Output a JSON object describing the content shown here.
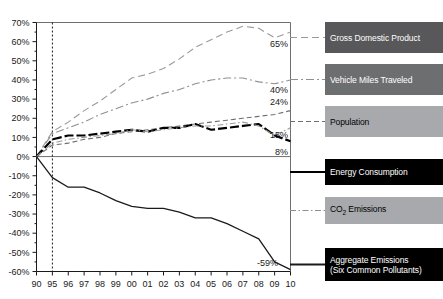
{
  "chart_data": {
    "type": "line",
    "title": "",
    "xlabel": "",
    "ylabel": "",
    "grid": false,
    "legend_position": "right",
    "x": [
      "90",
      "95",
      "96",
      "97",
      "98",
      "99",
      "00",
      "01",
      "02",
      "03",
      "04",
      "05",
      "06",
      "07",
      "08",
      "09",
      "10"
    ],
    "xtick_labels": [
      "90",
      "95",
      "96",
      "97",
      "98",
      "99",
      "00",
      "01",
      "02",
      "03",
      "04",
      "05",
      "06",
      "07",
      "08",
      "09",
      "10"
    ],
    "ytick_labels": [
      "70%",
      "60%",
      "50%",
      "40%",
      "30%",
      "20%",
      "10%",
      "0%",
      "-10%",
      "-20%",
      "-30%",
      "-40%",
      "-50%",
      "-60%"
    ],
    "ytick_values": [
      70,
      60,
      50,
      40,
      30,
      20,
      10,
      0,
      -10,
      -20,
      -30,
      -40,
      -50,
      -60
    ],
    "ylim": [
      -60,
      70
    ],
    "reference_line_x": "95",
    "zero_line_y": 0,
    "series": [
      {
        "name": "Gross Domestic Product",
        "key": "gdp",
        "dash": "long-dash",
        "color": "#9a9a9a",
        "end_label": "65%",
        "values": [
          0,
          13,
          18,
          24,
          29,
          35,
          41,
          43,
          46,
          51,
          57,
          61,
          65,
          68,
          67,
          62,
          65
        ]
      },
      {
        "name": "Vehicle Miles Traveled",
        "key": "vmt",
        "dash": "dash-dot",
        "color": "#8f8f8f",
        "end_label": "40%",
        "values": [
          0,
          12,
          15,
          18,
          22,
          25,
          28,
          30,
          33,
          35,
          38,
          40,
          41,
          41,
          39,
          38,
          40
        ]
      },
      {
        "name": "Population",
        "key": "population",
        "dash": "medium-dash",
        "color": "#6f6f6f",
        "end_label": "24%",
        "values": [
          0,
          6,
          7,
          9,
          10,
          12,
          13,
          14,
          15,
          16,
          17,
          18,
          19,
          20,
          21,
          22,
          24
        ]
      },
      {
        "name": "Energy Consumption",
        "key": "energy",
        "dash": "heavy-dash",
        "color": "#000000",
        "end_label": "8%",
        "values": [
          0,
          9,
          11,
          11,
          12,
          13,
          14,
          13,
          15,
          15,
          17,
          14,
          15,
          16,
          17,
          11,
          8
        ]
      },
      {
        "name": "CO2 Emissions",
        "key": "co2",
        "dash": "dash-dot-fine",
        "color": "#9a9a9a",
        "end_label": "15%",
        "values": [
          0,
          7,
          9,
          10,
          11,
          12,
          14,
          13,
          14,
          15,
          16,
          16,
          17,
          18,
          16,
          11,
          15
        ]
      },
      {
        "name": "Aggregate Emissions (Six Common Pollutants)",
        "key": "aggregate",
        "dash": "solid",
        "color": "#1a1a1a",
        "end_label": "-59%",
        "values": [
          0,
          -11,
          -16,
          -16,
          -19,
          -23,
          -26,
          -27,
          -27,
          -29,
          -32,
          -32,
          -35,
          -39,
          -43,
          -55,
          -59
        ]
      }
    ]
  },
  "point_labels": [
    {
      "text": "65%",
      "series": "gdp"
    },
    {
      "text": "40%",
      "series": "vmt"
    },
    {
      "text": "24%",
      "series": "population"
    },
    {
      "text": "15%",
      "series": "co2"
    },
    {
      "text": "8%",
      "series": "energy"
    },
    {
      "text": "-59%",
      "series": "aggregate"
    }
  ],
  "legend": {
    "items": [
      {
        "label": "Gross Domestic Product",
        "swatch": "#58585a",
        "text_color": "light",
        "dash": "long-dash",
        "line_color": "#9a9a9a"
      },
      {
        "label": "Vehicle Miles Traveled",
        "swatch": "#6d6e70",
        "text_color": "light",
        "dash": "dash-dot",
        "line_color": "#8f8f8f"
      },
      {
        "label": "Population",
        "swatch": "#a7a9ac",
        "text_color": "dark",
        "dash": "medium-dash",
        "line_color": "#6f6f6f"
      },
      {
        "label": "Energy Consumption",
        "swatch": "#000000",
        "text_color": "light",
        "dash": "solid-heavy",
        "line_color": "#000000"
      },
      {
        "label": "CO2 Emissions",
        "swatch": "#a7a9ac",
        "text_color": "dark",
        "dash": "dash-dot-fine",
        "line_color": "#8f8f8f"
      },
      {
        "label": "Aggregate Emissions",
        "label2": "(Six Common Pollutants)",
        "swatch": "#000000",
        "text_color": "light",
        "dash": "solid",
        "line_color": "#1a1a1a"
      }
    ]
  }
}
